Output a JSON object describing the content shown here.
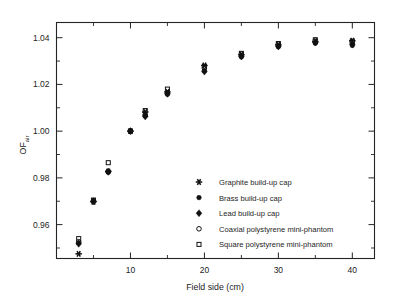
{
  "chart_data": {
    "type": "scatter",
    "title": "",
    "xlabel": "Field side (cm)",
    "ylabel": "OF",
    "ylabel_subscript": "air",
    "xlim": [
      0,
      43
    ],
    "ylim": [
      0.9455,
      1.0465
    ],
    "grid": false,
    "legend_position": "inside-lower-right",
    "x_ticks_major": [
      10,
      20,
      30,
      40
    ],
    "x_tick_labels": [
      "10",
      "20",
      "30",
      "40"
    ],
    "x_ticks_minor": [
      5,
      15,
      25,
      35
    ],
    "y_ticks_major": [
      0.96,
      0.98,
      1.0,
      1.02,
      1.04
    ],
    "y_tick_labels": [
      "0.96",
      "0.98",
      "1.00",
      "1.02",
      "1.04"
    ],
    "y_ticks_minor": [
      0.95,
      0.97,
      0.99,
      1.01,
      1.03
    ],
    "x": [
      3,
      5,
      7,
      10,
      12,
      15,
      20,
      25,
      30,
      35,
      40
    ],
    "series": [
      {
        "name": "Graphite build-up cap",
        "marker": "asterisk-star",
        "values": [
          0.9475,
          0.9698,
          0.9828,
          1.0,
          1.0082,
          1.0168,
          1.0281,
          1.0327,
          1.0369,
          1.0383,
          1.0387
        ]
      },
      {
        "name": "Brass build-up cap",
        "marker": "filled-circle",
        "values": [
          0.9522,
          0.9698,
          0.9824,
          1.0,
          1.0067,
          1.0158,
          1.0258,
          1.0318,
          1.0361,
          1.0376,
          1.0367
        ]
      },
      {
        "name": "Lead build-up cap",
        "marker": "filled-diamond",
        "values": [
          0.9518,
          0.97,
          0.9826,
          1.0,
          1.0063,
          1.016,
          1.0255,
          1.032,
          1.0363,
          1.038,
          1.0372
        ]
      },
      {
        "name": "Coaxial polystyrene mini-phantom",
        "marker": "open-circle",
        "values": [
          0.9527,
          0.9702,
          0.9828,
          1.0,
          1.007,
          1.0163,
          1.027,
          1.033,
          1.0373,
          1.0389,
          1.0381
        ]
      },
      {
        "name": "Square polystyrene mini-phantom",
        "marker": "open-square",
        "values": [
          0.954,
          0.9705,
          0.9865,
          1.0,
          1.0088,
          1.018,
          1.0277,
          1.0333,
          1.0375,
          1.0391,
          1.0385
        ]
      }
    ]
  },
  "legend": {
    "entries": [
      {
        "label": "Graphite build-up cap",
        "marker": "asterisk-star"
      },
      {
        "label": "Brass build-up cap",
        "marker": "filled-circle"
      },
      {
        "label": "Lead build-up cap",
        "marker": "filled-diamond"
      },
      {
        "label": "Coaxial polystyrene mini-phantom",
        "marker": "open-circle"
      },
      {
        "label": "Square polystyrene mini-phantom",
        "marker": "open-square"
      }
    ]
  },
  "colors": {
    "axis": "#242424",
    "marker": "#111111",
    "background": "#ffffff",
    "text": "#1d1d1d"
  }
}
